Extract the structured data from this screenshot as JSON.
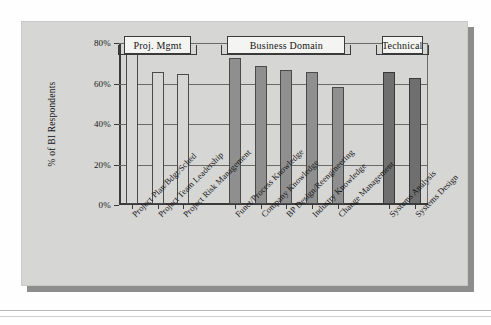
{
  "figure": {
    "background_color": "#d6d6d4",
    "shadow_color": "#8d8d8d"
  },
  "chart_data": {
    "type": "bar",
    "title": "",
    "xlabel": "",
    "ylabel": "% of BI Respondents",
    "ylim": [
      0,
      80
    ],
    "ytick_labels": [
      "0%",
      "20%",
      "40%",
      "60%",
      "80%"
    ],
    "ytick_values": [
      0,
      20,
      40,
      60,
      80
    ],
    "grid": true,
    "legend_position": "none",
    "categories": [
      "Project Plan/Bdgt/Sched",
      "Project Team Leadership",
      "Project Risk Management",
      "Funct/Process Knowledge",
      "Company Knowledge",
      "BP Design/Reengineering",
      "Industry Knowledge",
      "Change Management",
      "Systems Analysis",
      "Systems Design"
    ],
    "values": [
      75,
      65,
      64,
      72,
      68,
      66,
      65,
      58,
      65,
      62
    ],
    "bar_groups": [
      {
        "name": "Proj. Mgmt",
        "indices": [
          0,
          1,
          2
        ],
        "color": "#d6d6d4"
      },
      {
        "name": "Business Domain",
        "indices": [
          3,
          4,
          5,
          6,
          7
        ],
        "color": "#8f8f8f"
      },
      {
        "name": "Technical",
        "indices": [
          8,
          9
        ],
        "color": "#6f6f6f"
      }
    ]
  },
  "group_headers": [
    {
      "label": "Proj. Mgmt"
    },
    {
      "label": "Business Domain"
    },
    {
      "label": "Technical"
    }
  ]
}
